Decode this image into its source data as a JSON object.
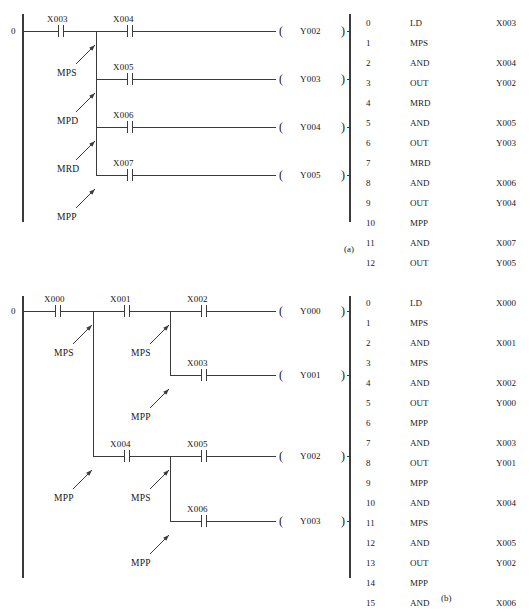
{
  "figure": {
    "captions": [
      {
        "text": "(a)",
        "x": 344,
        "y": 248
      },
      {
        "text": "(b)",
        "x": 441,
        "y": 597
      }
    ]
  },
  "diagram_a": {
    "caption": "(a)",
    "rung_index": "0",
    "left_rail": {
      "x": 23,
      "y1": 14,
      "y2": 222
    },
    "right_rail": {
      "x": 350,
      "y1": 14,
      "y2": 222
    },
    "branch_x": 96,
    "rungs": [
      {
        "y": 31,
        "contact": "X004",
        "coil": "Y002"
      },
      {
        "y": 79,
        "contact": "X005",
        "coil": "Y003"
      },
      {
        "y": 127,
        "contact": "X006",
        "coil": "Y004"
      },
      {
        "y": 175,
        "contact": "X007",
        "coil": "Y005"
      }
    ],
    "first_contact": "X003",
    "stack_notes": [
      {
        "text": "MPS",
        "x": 57,
        "y": 73,
        "ax1": 76,
        "ay1": 64,
        "ax2": 95,
        "ay2": 45
      },
      {
        "text": "MPD",
        "x": 57,
        "y": 121,
        "ax1": 76,
        "ay1": 112,
        "ax2": 95,
        "ay2": 93
      },
      {
        "text": "MRD",
        "x": 57,
        "y": 169,
        "ax1": 76,
        "ay1": 160,
        "ax2": 95,
        "ay2": 141
      },
      {
        "text": "MPP",
        "x": 57,
        "y": 217,
        "ax1": 76,
        "ay1": 208,
        "ax2": 95,
        "ay2": 189
      }
    ],
    "coil_open": "(",
    "coil_close": ")"
  },
  "diagram_b": {
    "caption": "(b)",
    "rung_index": "0",
    "left_rail": {
      "x": 23,
      "y1": 296,
      "y2": 578
    },
    "right_rail": {
      "x": 350,
      "y1": 296,
      "y2": 578
    },
    "branch1_x": 93,
    "branch2_x": 170,
    "branch3_x": 170,
    "first_contact": "X000",
    "rungs": [
      {
        "y": 311,
        "contacts": [
          "X001",
          "X002"
        ],
        "coil": "Y000"
      },
      {
        "y": 375,
        "contacts": [
          "X003"
        ],
        "coil": "Y001"
      },
      {
        "y": 456,
        "contacts": [
          "X004",
          "X005"
        ],
        "coil": "Y002"
      },
      {
        "y": 521,
        "contacts": [
          "X006"
        ],
        "coil": "Y003"
      }
    ],
    "stack_notes": [
      {
        "text": "MPS",
        "x": 54,
        "y": 353,
        "ax1": 73,
        "ay1": 344,
        "ax2": 92,
        "ay2": 325
      },
      {
        "text": "MPS",
        "x": 131,
        "y": 353,
        "ax1": 150,
        "ay1": 344,
        "ax2": 169,
        "ay2": 325
      },
      {
        "text": "MPP",
        "x": 131,
        "y": 417,
        "ax1": 150,
        "ay1": 408,
        "ax2": 169,
        "ay2": 389
      },
      {
        "text": "MPP",
        "x": 54,
        "y": 498,
        "ax1": 73,
        "ay1": 489,
        "ax2": 92,
        "ay2": 470
      },
      {
        "text": "MPS",
        "x": 131,
        "y": 498,
        "ax1": 150,
        "ay1": 489,
        "ax2": 169,
        "ay2": 470
      },
      {
        "text": "MPP",
        "x": 131,
        "y": 563,
        "ax1": 150,
        "ay1": 554,
        "ax2": 169,
        "ay2": 535
      }
    ],
    "coil_open": "(",
    "coil_close": ")"
  },
  "instruction_list_a": {
    "x": 366,
    "y": 18,
    "rows": [
      {
        "step": "0",
        "mnemonic": "LD",
        "operand": "X003"
      },
      {
        "step": "1",
        "mnemonic": "MPS",
        "operand": ""
      },
      {
        "step": "2",
        "mnemonic": "AND",
        "operand": "X004"
      },
      {
        "step": "3",
        "mnemonic": "OUT",
        "operand": "Y002"
      },
      {
        "step": "4",
        "mnemonic": "MRD",
        "operand": ""
      },
      {
        "step": "5",
        "mnemonic": "AND",
        "operand": "X005"
      },
      {
        "step": "6",
        "mnemonic": "OUT",
        "operand": "Y003"
      },
      {
        "step": "7",
        "mnemonic": "MRD",
        "operand": ""
      },
      {
        "step": "8",
        "mnemonic": "AND",
        "operand": "X006"
      },
      {
        "step": "9",
        "mnemonic": "OUT",
        "operand": "Y004"
      },
      {
        "step": "10",
        "mnemonic": "MPP",
        "operand": ""
      },
      {
        "step": "11",
        "mnemonic": "AND",
        "operand": "X007"
      },
      {
        "step": "12",
        "mnemonic": "OUT",
        "operand": "Y005"
      }
    ]
  },
  "instruction_list_b": {
    "x": 366,
    "y": 298,
    "rows": [
      {
        "step": "0",
        "mnemonic": "LD",
        "operand": "X000"
      },
      {
        "step": "1",
        "mnemonic": "MPS",
        "operand": ""
      },
      {
        "step": "2",
        "mnemonic": "AND",
        "operand": "X001"
      },
      {
        "step": "3",
        "mnemonic": "MPS",
        "operand": ""
      },
      {
        "step": "4",
        "mnemonic": "AND",
        "operand": "X002"
      },
      {
        "step": "5",
        "mnemonic": "OUT",
        "operand": "Y000"
      },
      {
        "step": "6",
        "mnemonic": "MPP",
        "operand": ""
      },
      {
        "step": "7",
        "mnemonic": "AND",
        "operand": "X003"
      },
      {
        "step": "8",
        "mnemonic": "OUT",
        "operand": "Y001"
      },
      {
        "step": "9",
        "mnemonic": "MPP",
        "operand": ""
      },
      {
        "step": "10",
        "mnemonic": "AND",
        "operand": "X004"
      },
      {
        "step": "11",
        "mnemonic": "MPS",
        "operand": ""
      },
      {
        "step": "12",
        "mnemonic": "AND",
        "operand": "X005"
      },
      {
        "step": "13",
        "mnemonic": "OUT",
        "operand": "Y002"
      },
      {
        "step": "14",
        "mnemonic": "MPP",
        "operand": ""
      },
      {
        "step": "15",
        "mnemonic": "AND",
        "operand": "X006"
      },
      {
        "step": "16",
        "mnemonic": "OUT",
        "operand": "Y003"
      }
    ]
  },
  "style": {
    "line_color": "#3b3b3b",
    "text_color": "#161616",
    "background": "#ffffff"
  }
}
